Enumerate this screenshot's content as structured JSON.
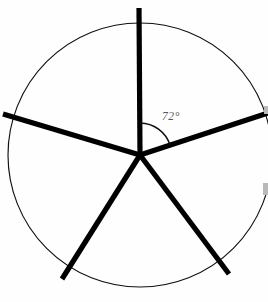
{
  "figure": {
    "canvas": {
      "width": 268,
      "height": 302,
      "background": "#fefefe"
    },
    "circle": {
      "name": "circle-outline",
      "cx": 140,
      "cy": 155,
      "r": 132,
      "stroke_color": "#111111",
      "stroke_width": 1.15,
      "fill": "none"
    },
    "center_point": {
      "x": 140,
      "y": 155
    },
    "spoke_style": {
      "color": "#000000",
      "width": 5.2
    },
    "spoke_count": 5,
    "spoke_separation_degrees": 72,
    "spokes": [
      {
        "label": "spoke-up",
        "angle_deg": 90,
        "x1": 140,
        "y1": 155,
        "x2": 139,
        "y2": 8
      },
      {
        "label": "spoke-upper-right",
        "angle_deg": 18,
        "x1": 140,
        "y1": 155,
        "x2": 268,
        "y2": 113
      },
      {
        "label": "spoke-lower-right",
        "angle_deg": -54,
        "x1": 140,
        "y1": 155,
        "x2": 229,
        "y2": 274
      },
      {
        "label": "spoke-lower-left",
        "angle_deg": -126,
        "x1": 140,
        "y1": 155,
        "x2": 62,
        "y2": 279
      },
      {
        "label": "spoke-upper-left",
        "angle_deg": 162,
        "x1": 140,
        "y1": 155,
        "x2": 3,
        "y2": 114
      }
    ],
    "angle_marker": {
      "value": "72",
      "unit": "°",
      "text": "72°",
      "arc_radius": 32,
      "arc_start_angle_deg": 90,
      "arc_end_angle_deg": 18,
      "arc_path": "M 140 123 A 32 32 0 0 1 170 145",
      "label_x": 162,
      "label_y": 120,
      "label_color": "#555555",
      "stroke_color": "#111111"
    },
    "artifacts": [
      {
        "name": "right-edge-smudge-upper",
        "x": 264,
        "y": 106,
        "w": 4,
        "h": 8
      },
      {
        "name": "right-edge-smudge-lower",
        "x": 263,
        "y": 183,
        "w": 5,
        "h": 12
      }
    ]
  }
}
